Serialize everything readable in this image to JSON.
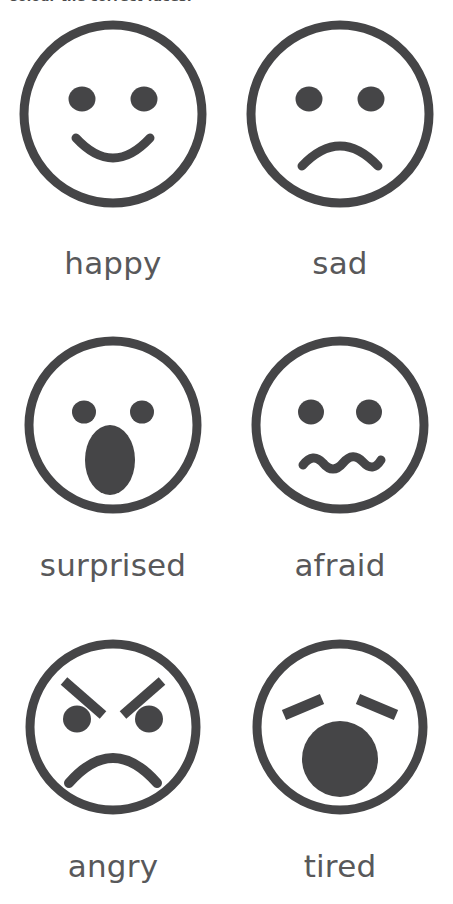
{
  "worksheet": {
    "instruction": "Colour the correct faces.",
    "ink_color": "#454547",
    "label_color": "#58585a",
    "background_color": "#ffffff"
  },
  "faces": [
    {
      "label": "happy",
      "icon": "happy-face-icon",
      "eyes": "two round filled dots",
      "mouth": "upward curved smile arc",
      "row": 1,
      "column": "left"
    },
    {
      "label": "sad",
      "icon": "sad-face-icon",
      "eyes": "two round filled dots",
      "mouth": "downward curved frown arc",
      "row": 1,
      "column": "right"
    },
    {
      "label": "surprised",
      "icon": "surprised-face-icon",
      "eyes": "two small round filled dots",
      "mouth": "large filled vertical oval",
      "row": 2,
      "column": "left"
    },
    {
      "label": "afraid",
      "icon": "afraid-face-icon",
      "eyes": "two round filled dots",
      "mouth": "wavy squiggle line",
      "row": 2,
      "column": "right"
    },
    {
      "label": "angry",
      "icon": "angry-face-icon",
      "eyes": "two round filled dots with angled eyebrows",
      "mouth": "deep downward frown arc",
      "row": 3,
      "column": "left"
    },
    {
      "label": "tired",
      "icon": "tired-face-icon",
      "eyes": "two angled closed-eye dashes",
      "mouth": "large filled circle yawn",
      "row": 3,
      "column": "right"
    }
  ]
}
